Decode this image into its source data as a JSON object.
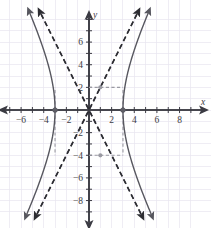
{
  "figure": {
    "width": 211,
    "height": 228,
    "background_color": "#ffffff",
    "axis_color": "#3b3b43",
    "grid_color": "#e8e6ef",
    "curve_color": "#57575f",
    "asymptote_color": "#2d2d33",
    "marker_color": "#5e5e66",
    "helper_color": "#9a9aa2"
  },
  "axes": {
    "x_axis_label": "x",
    "y_axis_label": "y",
    "x_tick_labels": [
      "−6",
      "−4",
      "−2",
      "2",
      "4",
      "6",
      "8"
    ],
    "x_tick_values": [
      -6,
      -4,
      -2,
      2,
      4,
      6,
      8
    ],
    "y_tick_labels": [
      "6",
      "4",
      "2",
      "−2",
      "−4",
      "−6",
      "−8"
    ],
    "y_tick_values": [
      6,
      4,
      2,
      -2,
      -4,
      -6,
      -8
    ],
    "x_min": -7.6,
    "x_max": 9.6,
    "y_min": -9.6,
    "y_max": 8.1,
    "origin_px": [
      89,
      110
    ],
    "unit_px": 11.32,
    "grid": true,
    "grid_step": 1
  },
  "chart_data": {
    "type": "line",
    "title": "",
    "subtitle": "",
    "xlabel": "x",
    "ylabel": "y",
    "xlim": [
      -7.6,
      9.6
    ],
    "ylim": [
      -9.6,
      8.1
    ],
    "grid": true,
    "legend": "none",
    "equation": "x^2/9 - y^2/36 = 1",
    "center": [
      0,
      0
    ],
    "a": 3,
    "b": 6,
    "vertices": [
      {
        "x": -3,
        "y": 0,
        "label": "(−3, 0)"
      },
      {
        "x": 3,
        "y": 0,
        "label": "(3, 0)"
      }
    ],
    "asymptote_slopes": [
      2,
      -2
    ],
    "series": [
      {
        "name": "right-branch",
        "style": "solid",
        "color": "#57575f",
        "points": [
          [
            3,
            0
          ],
          [
            3.05,
            1.105
          ],
          [
            3.12,
            1.731
          ],
          [
            3.25,
            2.55
          ],
          [
            3.4,
            3.206
          ],
          [
            3.6,
            3.965
          ],
          [
            3.9,
            4.974
          ],
          [
            4.2,
            5.886
          ],
          [
            4.6,
            7.018
          ],
          [
            5.0,
            8.0
          ],
          [
            5.4,
            9.0
          ],
          [
            5.8,
            9.9
          ],
          [
            6.2,
            10.9
          ]
        ]
      },
      {
        "name": "left-branch",
        "style": "solid",
        "color": "#57575f",
        "points": [
          [
            -3,
            0
          ],
          [
            -3.05,
            1.105
          ],
          [
            -3.12,
            1.731
          ],
          [
            -3.25,
            2.55
          ],
          [
            -3.4,
            3.206
          ],
          [
            -3.6,
            3.965
          ],
          [
            -3.9,
            4.974
          ],
          [
            -4.2,
            5.886
          ],
          [
            -4.6,
            7.018
          ],
          [
            -5.0,
            8.0
          ],
          [
            -5.4,
            9.0
          ],
          [
            -5.8,
            9.9
          ],
          [
            -6.2,
            10.9
          ]
        ]
      },
      {
        "name": "asymptote-positive-slope",
        "style": "dashed",
        "color": "#2d2d33",
        "slope": 2,
        "intercept": 0
      },
      {
        "name": "asymptote-negative-slope",
        "style": "dashed",
        "color": "#2d2d33",
        "slope": -2,
        "intercept": 0
      }
    ],
    "reference_points": [
      {
        "x": 1,
        "y": 2,
        "color": "#9a9aa2",
        "note": "gray dot on upper helper segment"
      },
      {
        "x": 1,
        "y": -4,
        "color": "#9a9aa2",
        "note": "gray dot on lower helper segment"
      }
    ],
    "reference_segments": [
      {
        "from": [
          0,
          2
        ],
        "to": [
          3,
          2
        ],
        "style": "dashed",
        "color": "#9a9aa2"
      },
      {
        "from": [
          0,
          -4
        ],
        "to": [
          3,
          -4
        ],
        "style": "dashed",
        "color": "#9a9aa2"
      },
      {
        "from": [
          -3,
          0
        ],
        "to": [
          -3,
          2
        ],
        "style": "dashed",
        "color": "#9a9aa2"
      },
      {
        "from": [
          -3,
          0
        ],
        "to": [
          -3,
          -4
        ],
        "style": "dashed",
        "color": "#9a9aa2"
      },
      {
        "from": [
          3,
          0
        ],
        "to": [
          3,
          2
        ],
        "style": "dashed",
        "color": "#9a9aa2"
      },
      {
        "from": [
          3,
          0
        ],
        "to": [
          3,
          -4
        ],
        "style": "dashed",
        "color": "#9a9aa2"
      }
    ]
  }
}
